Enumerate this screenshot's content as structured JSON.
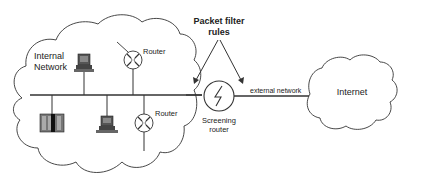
{
  "diagram": {
    "labels": {
      "internal_network_line1": "Internal",
      "internal_network_line2": "Network",
      "router_top": "Router",
      "router_bottom": "Router",
      "packet_filter_line1": "Packet filter",
      "packet_filter_line2": "rules",
      "screening_router_line1": "Screening",
      "screening_router_line2": "router",
      "external_network": "external network",
      "internet": "Internet"
    },
    "nodes": [
      {
        "id": "internal-network",
        "type": "cloud",
        "label": "Internal Network"
      },
      {
        "id": "workstation-top",
        "type": "computer"
      },
      {
        "id": "router-top",
        "type": "router",
        "label": "Router"
      },
      {
        "id": "server",
        "type": "server"
      },
      {
        "id": "workstation-bottom",
        "type": "computer"
      },
      {
        "id": "router-bottom",
        "type": "router",
        "label": "Router"
      },
      {
        "id": "screening-router",
        "type": "screening-router",
        "label": "Screening router"
      },
      {
        "id": "internet",
        "type": "cloud",
        "label": "Internet"
      }
    ],
    "edges": [
      {
        "from": "internal-network-backbone",
        "to": "screening-router"
      },
      {
        "from": "screening-router",
        "to": "internet",
        "label": "external network"
      }
    ],
    "colors": {
      "stroke": "#333333",
      "text": "#222222",
      "device_fill": "#555555",
      "background": "#ffffff"
    }
  }
}
